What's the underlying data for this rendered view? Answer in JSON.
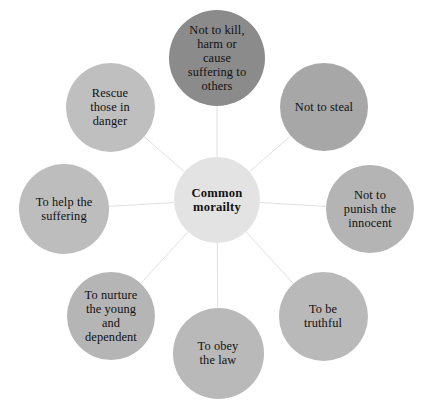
{
  "diagram": {
    "type": "hub-and-spoke",
    "title_node": {
      "id": "center",
      "label": "Common\nmorailty",
      "color": "#e3e3e3",
      "cx": 217,
      "cy": 200,
      "d": 86
    },
    "spoke_color": "#e0e0e0",
    "background": "#ffffff",
    "nodes": [
      {
        "id": "not-to-kill",
        "label": "Not to kill,\nharm or\ncause\nsuffering to\nothers",
        "color": "#8b8b8b",
        "cx": 217,
        "cy": 58,
        "d": 96
      },
      {
        "id": "not-to-steal",
        "label": "Not to steal",
        "color": "#a7a7a7",
        "cx": 324,
        "cy": 107,
        "d": 88
      },
      {
        "id": "not-to-punish-the-innocent",
        "label": "Not to\npunish the\ninnocent",
        "color": "#b4b4b4",
        "cx": 370,
        "cy": 209,
        "d": 88
      },
      {
        "id": "to-be-truthful",
        "label": "To be\ntruthful",
        "color": "#b9b9b9",
        "cx": 323,
        "cy": 316,
        "d": 89
      },
      {
        "id": "to-obey-the-law",
        "label": "To obey\nthe law",
        "color": "#b9b9b9",
        "cx": 218,
        "cy": 353,
        "d": 91
      },
      {
        "id": "to-nurture-the-young-and-dependent",
        "label": "To nurture\nthe young\nand\ndependent",
        "color": "#b5b5b5",
        "cx": 111,
        "cy": 316,
        "d": 88
      },
      {
        "id": "to-help-the-suffering",
        "label": "To help the\nsuffering",
        "color": "#bdbdbd",
        "cx": 64,
        "cy": 209,
        "d": 90
      },
      {
        "id": "rescue-those-in-danger",
        "label": "Rescue\nthose in\ndanger",
        "color": "#bfbfbf",
        "cx": 110,
        "cy": 107,
        "d": 89
      }
    ]
  }
}
